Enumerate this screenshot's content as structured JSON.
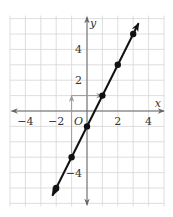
{
  "chart_data": {
    "type": "line",
    "title": "",
    "xlabel": "x",
    "ylabel": "y",
    "origin_label": "O",
    "xlim": [
      -5,
      5
    ],
    "ylim": [
      -6,
      6
    ],
    "grid": true,
    "x_ticks": [
      -4,
      -2,
      2,
      4
    ],
    "x_tick_labels": [
      "−4",
      "−2",
      "2",
      "4"
    ],
    "y_ticks": [
      4,
      2,
      -4
    ],
    "y_tick_labels": [
      "4",
      "2",
      "−4"
    ],
    "series": [
      {
        "name": "y = 2x - 1",
        "equation": "y = 2x - 1",
        "slope": 2,
        "intercept": -1,
        "line_extent": [
          [
            -2.25,
            -5.5
          ],
          [
            3.35,
            5.7
          ]
        ],
        "points": [
          {
            "x": -2,
            "y": -5
          },
          {
            "x": -1,
            "y": -3
          },
          {
            "x": 0,
            "y": -1
          },
          {
            "x": 1,
            "y": 1
          },
          {
            "x": 2,
            "y": 3
          },
          {
            "x": 3,
            "y": 5
          }
        ]
      }
    ],
    "annotations": [
      {
        "type": "rise-arrow",
        "from": {
          "x": -1,
          "y": -3
        },
        "to": {
          "x": -1,
          "y": 1
        },
        "label": "rise 4"
      },
      {
        "type": "run-arrow",
        "from": {
          "x": -1,
          "y": 1
        },
        "to": {
          "x": 1,
          "y": 1
        },
        "label": "run 2"
      }
    ]
  },
  "colors": {
    "grid": "#d6d6d6",
    "axis": "#666666",
    "line": "#111111",
    "slope_arrow": "#9a9a9a",
    "text": "#333333"
  }
}
